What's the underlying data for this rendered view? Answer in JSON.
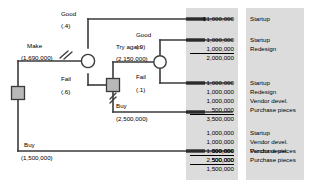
{
  "diagram": {
    "type": "decision-tree"
  },
  "nodes": {
    "root_decision": "decision-square-root",
    "chance_make": "chance-circle-make",
    "decision_fail": "decision-square-fail",
    "chance_tryagain": "chance-circle-try-again"
  },
  "branches": [
    {
      "name": "make",
      "label": "Make",
      "value": "(1,690,000)",
      "pruned": true
    },
    {
      "name": "good_1",
      "label": "Good",
      "value": "(.4)",
      "pruned": false
    },
    {
      "name": "fail_1",
      "label": "Fail",
      "value": "(.6)",
      "pruned": false
    },
    {
      "name": "try_again",
      "label": "Try again",
      "value": "(2,150,000)",
      "pruned": false
    },
    {
      "name": "good_2",
      "label": "Good",
      "value": "(.9)",
      "pruned": false
    },
    {
      "name": "fail_2",
      "label": "Fail",
      "value": "(.1)",
      "pruned": false
    },
    {
      "name": "buy_inner",
      "label": "Buy",
      "value": "(2,500,000)",
      "pruned": true
    },
    {
      "name": "buy_root",
      "label": "Buy",
      "value": "(1,500,000)",
      "pruned": false
    }
  ],
  "outcomes": [
    {
      "name": "outcome-1",
      "amounts": [
        {
          "text": "$1,000,000",
          "underline": false
        }
      ],
      "total": null,
      "categories": [
        "Startup"
      ]
    },
    {
      "name": "outcome-2",
      "amounts": [
        {
          "text": "1,000,000",
          "underline": false
        },
        {
          "text": "1,000,000",
          "underline": true
        }
      ],
      "total": "2,000,000",
      "categories": [
        "Startup",
        "Redesign"
      ]
    },
    {
      "name": "outcome-3",
      "amounts": [
        {
          "text": "1,000,000",
          "underline": false
        },
        {
          "text": "1,000,000",
          "underline": false
        },
        {
          "text": "1,000,000",
          "underline": false
        },
        {
          "text": "500,000",
          "underline": true
        }
      ],
      "total": "3,500,000",
      "categories": [
        "Startup",
        "Redesign",
        "Vendor devel.",
        "Purchase pieces"
      ]
    },
    {
      "name": "outcome-4",
      "amounts": [
        {
          "text": "1,000,000",
          "underline": false
        },
        {
          "text": "1,000,000",
          "underline": false
        },
        {
          "text": "500,000",
          "underline": true
        }
      ],
      "total": "2,500,000",
      "categories": [
        "Startup",
        "Vendor devel.",
        "Purchase pieces"
      ]
    },
    {
      "name": "outcome-5",
      "amounts": [
        {
          "text": "1,000,000",
          "underline": false
        },
        {
          "text": "500,000",
          "underline": true
        }
      ],
      "total": "1,500,000",
      "categories": [
        "Vendor devel.",
        "Purchase pieces"
      ]
    }
  ],
  "colors": {
    "line": "#3a3a3a",
    "node_fill": "#b8b8b8",
    "panel": "#dcdcdc",
    "text": "#000000"
  }
}
